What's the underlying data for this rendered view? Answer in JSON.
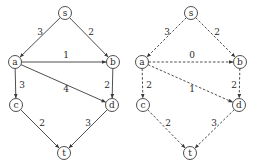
{
  "graphs": [
    {
      "id": "left",
      "style": "solid",
      "nodes": [
        {
          "id": "s",
          "label": "s",
          "x": 65,
          "y": 13
        },
        {
          "id": "a",
          "label": "a",
          "x": 15,
          "y": 62
        },
        {
          "id": "b",
          "label": "b",
          "x": 113,
          "y": 62
        },
        {
          "id": "c",
          "label": "c",
          "x": 16,
          "y": 105
        },
        {
          "id": "d",
          "label": "d",
          "x": 112,
          "y": 105
        },
        {
          "id": "t",
          "label": "t",
          "x": 64,
          "y": 153
        }
      ],
      "edges": [
        {
          "from": "s",
          "to": "a",
          "weight": "3",
          "lx": 40,
          "ly": 32
        },
        {
          "from": "s",
          "to": "b",
          "weight": "2",
          "lx": 91,
          "ly": 32
        },
        {
          "from": "a",
          "to": "b",
          "weight": "1",
          "lx": 66,
          "ly": 55
        },
        {
          "from": "a",
          "to": "c",
          "weight": "3",
          "lx": 22,
          "ly": 85
        },
        {
          "from": "a",
          "to": "d",
          "weight": "4",
          "lx": 66,
          "ly": 89
        },
        {
          "from": "b",
          "to": "d",
          "weight": "2",
          "lx": 107,
          "ly": 85
        },
        {
          "from": "c",
          "to": "t",
          "weight": "2",
          "lx": 42,
          "ly": 123
        },
        {
          "from": "d",
          "to": "t",
          "weight": "3",
          "lx": 88,
          "ly": 123
        }
      ]
    },
    {
      "id": "right",
      "style": "dashed",
      "nodes": [
        {
          "id": "s",
          "label": "s",
          "x": 191,
          "y": 13
        },
        {
          "id": "a",
          "label": "a",
          "x": 142,
          "y": 62
        },
        {
          "id": "b",
          "label": "b",
          "x": 240,
          "y": 62
        },
        {
          "id": "c",
          "label": "c",
          "x": 143,
          "y": 105
        },
        {
          "id": "d",
          "label": "d",
          "x": 239,
          "y": 105
        },
        {
          "id": "t",
          "label": "t",
          "x": 190,
          "y": 153
        }
      ],
      "edges": [
        {
          "from": "s",
          "to": "a",
          "weight": "3",
          "lx": 167,
          "ly": 32
        },
        {
          "from": "s",
          "to": "b",
          "weight": "2",
          "lx": 217,
          "ly": 32
        },
        {
          "from": "a",
          "to": "b",
          "weight": "0",
          "lx": 192,
          "ly": 55
        },
        {
          "from": "a",
          "to": "c",
          "weight": "2",
          "lx": 149,
          "ly": 85
        },
        {
          "from": "a",
          "to": "d",
          "weight": "1",
          "lx": 192,
          "ly": 89
        },
        {
          "from": "b",
          "to": "d",
          "weight": "2",
          "lx": 234,
          "ly": 85
        },
        {
          "from": "c",
          "to": "t",
          "weight": "2",
          "lx": 168,
          "ly": 123
        },
        {
          "from": "d",
          "to": "t",
          "weight": "3",
          "lx": 214,
          "ly": 123
        }
      ]
    }
  ],
  "node_radius": 6.5,
  "colors": {
    "stroke": "#3a3a3a",
    "text": "#2a2a2a",
    "background": "#ffffff"
  }
}
